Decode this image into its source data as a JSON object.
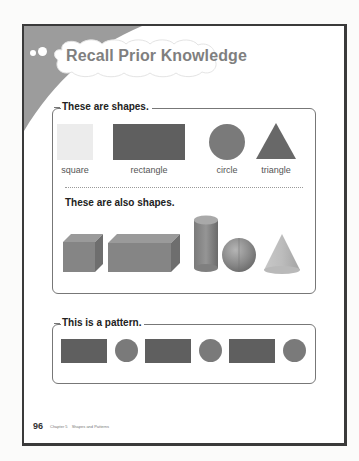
{
  "header": {
    "title": "Recall Prior Knowledge",
    "icon": "cloud-banner-icon"
  },
  "section_shapes": {
    "title": "These are shapes.",
    "shapes_2d": [
      {
        "label": "square",
        "icon": "square-icon",
        "color": "#ebebeb"
      },
      {
        "label": "rectangle",
        "icon": "rectangle-icon",
        "color": "#5e5e5e"
      },
      {
        "label": "circle",
        "icon": "circle-icon",
        "color": "#7a7a7a"
      },
      {
        "label": "triangle",
        "icon": "triangle-icon",
        "color": "#6a6a6a"
      }
    ],
    "subtitle": "These are also shapes.",
    "shapes_3d": [
      {
        "name": "cube",
        "icon": "cube-icon"
      },
      {
        "name": "rectangular prism",
        "icon": "rectangular-prism-icon"
      },
      {
        "name": "cylinder",
        "icon": "cylinder-icon"
      },
      {
        "name": "sphere",
        "icon": "sphere-icon"
      },
      {
        "name": "cone",
        "icon": "cone-icon"
      }
    ]
  },
  "section_pattern": {
    "title": "This is a pattern.",
    "items": [
      "rectangle",
      "circle",
      "rectangle",
      "circle",
      "rectangle",
      "circle"
    ]
  },
  "footer": {
    "page_number": "96",
    "chapter": "Chapter 5",
    "chapter_title": "Shapes and Patterns"
  },
  "colors": {
    "frame": "#3a3a3a",
    "wedge": "#9c9c9c",
    "title_text": "#7f7f7f",
    "shape_dark": "#5e5e5e",
    "shape_mid": "#7a7a7a"
  }
}
